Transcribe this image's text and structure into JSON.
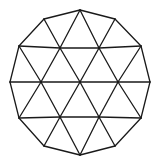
{
  "diagram": {
    "shape": "dodecagon",
    "outer_vertex_count": 12,
    "inner_vertex_count": 7,
    "stroke_color": "#1a1a1a",
    "background_color": "#ffffff"
  }
}
